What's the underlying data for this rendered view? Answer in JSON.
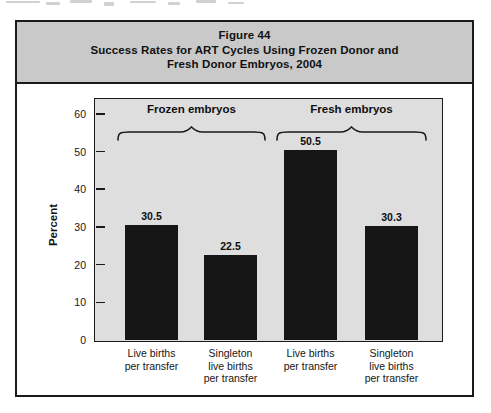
{
  "figure": {
    "header": {
      "line1": "Figure 44",
      "line2": "Success Rates for ART Cycles Using Frozen Donor and",
      "line3": "Fresh Donor Embryos, 2004",
      "bg_color": "#c9c9c9"
    }
  },
  "chart_data": {
    "type": "bar",
    "title": "Figure 44",
    "subtitle": "Success Rates for ART Cycles Using Frozen Donor and Fresh Donor Embryos, 2004",
    "ylabel": "Percent",
    "ylim": [
      0,
      64
    ],
    "yticks": [
      0,
      10,
      20,
      30,
      40,
      50,
      60
    ],
    "grid": false,
    "legend_position": "none",
    "plot_bg_color": "#dedede",
    "bar_color": "#161616",
    "categories": [
      "Live births per transfer",
      "Singleton live births per transfer",
      "Live births per transfer",
      "Singleton live births per transfer"
    ],
    "categories_lines": [
      [
        "Live births",
        "per transfer"
      ],
      [
        "Singleton",
        "live births",
        "per transfer"
      ],
      [
        "Live births",
        "per transfer"
      ],
      [
        "Singleton",
        "live births",
        "per transfer"
      ]
    ],
    "values": [
      30.5,
      22.5,
      50.5,
      30.3
    ],
    "value_labels": [
      "30.5",
      "22.5",
      "50.5",
      "30.3"
    ],
    "groups": [
      {
        "label": "Frozen embryos",
        "bar_indexes": [
          0,
          1
        ]
      },
      {
        "label": "Fresh embryos",
        "bar_indexes": [
          2,
          3
        ]
      }
    ]
  }
}
